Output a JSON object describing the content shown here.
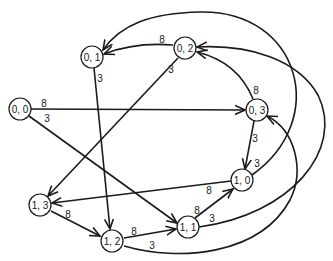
{
  "diagram": {
    "type": "directed-weighted-graph",
    "nodes": [
      {
        "id": "n00",
        "label": "0, 0",
        "x": 20,
        "y": 109
      },
      {
        "id": "n01",
        "label": "0, 1",
        "x": 92,
        "y": 57
      },
      {
        "id": "n02",
        "label": "0, 2",
        "x": 185,
        "y": 48
      },
      {
        "id": "n03",
        "label": "0, 3",
        "x": 257,
        "y": 110
      },
      {
        "id": "n10",
        "label": "1, 0",
        "x": 242,
        "y": 180
      },
      {
        "id": "n11",
        "label": "1, 1",
        "x": 188,
        "y": 227
      },
      {
        "id": "n12",
        "label": "1, 2",
        "x": 112,
        "y": 241
      },
      {
        "id": "n13",
        "label": "1, 3",
        "x": 40,
        "y": 205
      }
    ],
    "edges": [
      {
        "from": "0, 0",
        "to": "0, 3",
        "weight": "8"
      },
      {
        "from": "0, 0",
        "to": "1, 1",
        "weight": "3"
      },
      {
        "from": "0, 1",
        "to": "1, 2",
        "weight": "3"
      },
      {
        "from": "0, 2",
        "to": "0, 1",
        "weight": "8"
      },
      {
        "from": "0, 2",
        "to": "1, 3",
        "weight": "3"
      },
      {
        "from": "0, 3",
        "to": "0, 2",
        "weight": "8"
      },
      {
        "from": "0, 3",
        "to": "1, 0",
        "weight": "3"
      },
      {
        "from": "1, 0",
        "to": "1, 3",
        "weight": "8"
      },
      {
        "from": "1, 0",
        "to": "0, 1",
        "weight": "3"
      },
      {
        "from": "1, 1",
        "to": "1, 0",
        "weight": "8"
      },
      {
        "from": "1, 1",
        "to": "0, 2",
        "weight": "3"
      },
      {
        "from": "1, 2",
        "to": "1, 1",
        "weight": "8"
      },
      {
        "from": "1, 2",
        "to": "0, 3",
        "weight": "3"
      },
      {
        "from": "1, 3",
        "to": "1, 2",
        "weight": "8"
      }
    ],
    "labels": {
      "e00_03": "8",
      "e00_11": "3",
      "e01_12": "3",
      "e02_01": "8",
      "e02_13": "3",
      "e03_02": "8",
      "e03_10": "3",
      "e10_13": "8",
      "e10_01": "3",
      "e11_10": "8",
      "e11_02": "3",
      "e12_11": "8",
      "e12_03": "3",
      "e13_12": "8"
    },
    "colors": {
      "stroke": "#1a1a1a",
      "background": "#ffffff"
    }
  }
}
